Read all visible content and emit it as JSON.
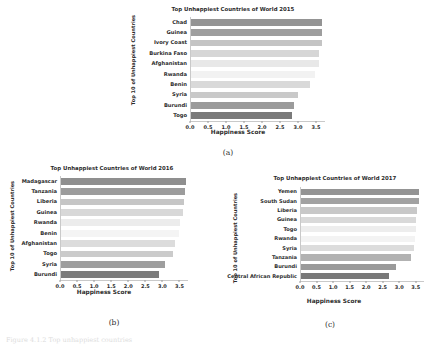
{
  "figure": {
    "caption_a": "(a)",
    "caption_b": "(b)",
    "caption_c": "(c)",
    "cutoff_text": "Figure 4.1.2  Top unhappiest countries"
  },
  "chart_data": [
    {
      "id": "a",
      "type": "bar",
      "orientation": "horizontal",
      "title": "Top Unhappiest Countries of World 2015",
      "xlabel": "Happiness Score",
      "ylabel": "Top 10 of Unhappiest Countries",
      "categories": [
        "Chad",
        "Guinea",
        "Ivory Coast",
        "Burkina Faso",
        "Afghanistan",
        "Rwanda",
        "Benin",
        "Syria",
        "Burundi",
        "Togo"
      ],
      "values": [
        3.67,
        3.66,
        3.66,
        3.59,
        3.58,
        3.47,
        3.34,
        3.01,
        2.9,
        2.84
      ],
      "colors": [
        "#949494",
        "#9e9e9e",
        "#c4c4c4",
        "#d6d6d6",
        "#e8e8e8",
        "#f2f2f2",
        "#d9d9d9",
        "#c9c9c9",
        "#9b9b9b",
        "#7a7a7a"
      ],
      "xlim": [
        0.0,
        3.75
      ],
      "xticks": [
        0.0,
        0.5,
        1.0,
        1.5,
        2.0,
        2.5,
        3.0,
        3.5
      ],
      "xticklabels": [
        "0.0",
        "0.5",
        "1.0",
        "1.5",
        "2.0",
        "2.5",
        "3.0",
        "3.5"
      ],
      "grid": false,
      "legend": "none"
    },
    {
      "id": "b",
      "type": "bar",
      "orientation": "horizontal",
      "title": "Top Unhappiest Countries of World 2016",
      "xlabel": "Happiness Score",
      "ylabel": "Top 10 of Unhappiest Countries",
      "categories": [
        "Madagascar",
        "Tanzania",
        "Liberia",
        "Guinea",
        "Rwanda",
        "Benin",
        "Afghanistan",
        "Togo",
        "Syria",
        "Burundi"
      ],
      "values": [
        3.7,
        3.67,
        3.62,
        3.61,
        3.52,
        3.48,
        3.36,
        3.3,
        3.07,
        2.9
      ],
      "colors": [
        "#8f8f8f",
        "#9c9c9c",
        "#c6c6c6",
        "#d8d8d8",
        "#ececec",
        "#f4f4f4",
        "#dcdcdc",
        "#cbcbcb",
        "#9e9e9e",
        "#7c7c7c"
      ],
      "xlim": [
        0.0,
        3.75
      ],
      "xticks": [
        0.0,
        0.5,
        1.0,
        1.5,
        2.0,
        2.5,
        3.0,
        3.5
      ],
      "xticklabels": [
        "0.0",
        "0.5",
        "1.0",
        "1.5",
        "2.0",
        "2.5",
        "3.0",
        "3.5"
      ],
      "grid": false,
      "legend": "none"
    },
    {
      "id": "c",
      "type": "bar",
      "orientation": "horizontal",
      "title": "Top Unhappiest Countries of World 2017",
      "xlabel": "Happiness Score",
      "ylabel": "Top 10 of Unhappiest Countries",
      "categories": [
        "Yemen",
        "South Sudan",
        "Liberia",
        "Guinea",
        "Togo",
        "Rwanda",
        "Syria",
        "Tanzania",
        "Burundi",
        "Central African Republic"
      ],
      "values": [
        3.59,
        3.59,
        3.53,
        3.51,
        3.5,
        3.47,
        3.46,
        3.35,
        2.9,
        2.69
      ],
      "colors": [
        "#949494",
        "#a2a2a2",
        "#c8c8c8",
        "#d9d9d9",
        "#ededed",
        "#f3f3f3",
        "#dcdcdc",
        "#b2b2b2",
        "#9a9a9a",
        "#797979"
      ],
      "xlim": [
        0.0,
        3.75
      ],
      "xticks": [
        0.0,
        0.5,
        1.0,
        1.5,
        2.0,
        2.5,
        3.0,
        3.5
      ],
      "xticklabels": [
        "0.0",
        "0.5",
        "1.0",
        "1.5",
        "2.0",
        "2.5",
        "3.0",
        "3.5"
      ],
      "grid": false,
      "legend": "none"
    }
  ]
}
